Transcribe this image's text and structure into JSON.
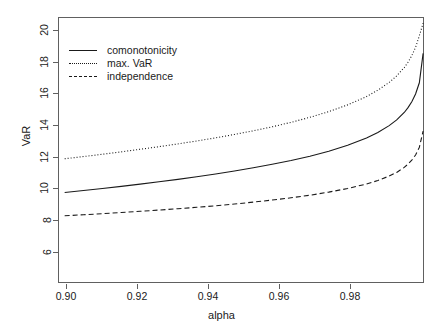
{
  "chart_data": {
    "type": "line",
    "title": "",
    "xlabel": "alpha",
    "ylabel": "VaR",
    "xlim": [
      0.8985,
      0.9955
    ],
    "ylim": [
      5.35,
      20.75
    ],
    "xticks": [
      0.9,
      0.92,
      0.94,
      0.96,
      0.98
    ],
    "xtick_labels": [
      "0.90",
      "0.92",
      "0.94",
      "0.96",
      "0.98"
    ],
    "yticks": [
      6,
      8,
      10,
      12,
      14,
      16,
      18,
      20
    ],
    "ytick_labels": [
      "6",
      "8",
      "10",
      "12",
      "14",
      "16",
      "18",
      "20"
    ],
    "grid": false,
    "legend_position": "top-left",
    "x": [
      0.9,
      0.905,
      0.91,
      0.915,
      0.92,
      0.925,
      0.93,
      0.935,
      0.94,
      0.945,
      0.95,
      0.955,
      0.96,
      0.965,
      0.97,
      0.975,
      0.98,
      0.983,
      0.986,
      0.988,
      0.99,
      0.991,
      0.992,
      0.993,
      0.994,
      0.995
    ],
    "series": [
      {
        "name": "comonotonicity",
        "linestyle": "solid",
        "color": "#1a1a1a",
        "values": [
          10.65,
          10.76,
          10.88,
          11.0,
          11.13,
          11.27,
          11.41,
          11.56,
          11.72,
          11.89,
          12.08,
          12.28,
          12.5,
          12.75,
          13.04,
          13.38,
          13.8,
          14.12,
          14.52,
          14.85,
          15.28,
          15.56,
          15.9,
          16.35,
          17.0,
          18.7
        ]
      },
      {
        "name": "max. VaR",
        "linestyle": "dotted",
        "color": "#1a1a1a",
        "values": [
          12.6,
          12.73,
          12.86,
          13.0,
          13.15,
          13.3,
          13.46,
          13.63,
          13.81,
          14.01,
          14.22,
          14.45,
          14.71,
          15.0,
          15.33,
          15.72,
          16.2,
          16.57,
          17.02,
          17.4,
          17.88,
          18.19,
          18.57,
          19.05,
          19.72,
          20.45
        ]
      },
      {
        "name": "independence",
        "linestyle": "dashed",
        "color": "#1a1a1a",
        "values": [
          9.3,
          9.36,
          9.42,
          9.49,
          9.56,
          9.63,
          9.71,
          9.79,
          9.88,
          9.98,
          10.09,
          10.21,
          10.34,
          10.49,
          10.67,
          10.88,
          11.14,
          11.34,
          11.6,
          11.81,
          12.1,
          12.29,
          12.52,
          12.82,
          13.26,
          14.2
        ]
      }
    ]
  },
  "legend": {
    "items": [
      {
        "label": "comonotonicity",
        "style": "solid"
      },
      {
        "label": "max. VaR",
        "style": "dotted"
      },
      {
        "label": "independence",
        "style": "dashed"
      }
    ]
  },
  "axes": {
    "x_title": "alpha",
    "y_title": "VaR"
  }
}
